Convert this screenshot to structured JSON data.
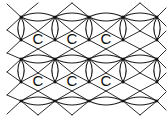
{
  "figure": {
    "kind": "chemical-structure-lattice",
    "background_color": "#ffffff",
    "line_color": "#1a1a1a",
    "vertex_color": "#111111",
    "label_color": "#0d0d0d",
    "canvas": {
      "width": 168,
      "height": 120
    }
  },
  "lattice": {
    "ring_columns": 3,
    "ring_rows": 2,
    "vertex_columns_x": [
      21,
      55,
      89,
      123,
      157
    ],
    "vertex_rows_y": [
      17,
      40,
      59,
      82,
      101
    ],
    "lens_bulge": 4.0,
    "vertex_size": 2.6
  },
  "atoms": [
    {
      "label": "C",
      "x": 38,
      "y": 38
    },
    {
      "label": "C",
      "x": 72,
      "y": 38
    },
    {
      "label": "C",
      "x": 106,
      "y": 38
    },
    {
      "label": "C",
      "x": 38,
      "y": 80
    },
    {
      "label": "C",
      "x": 72,
      "y": 80
    },
    {
      "label": "C",
      "x": 106,
      "y": 80
    }
  ],
  "horizontal_lens_edges": [
    {
      "x1": 21,
      "x2": 55,
      "y": 17
    },
    {
      "x1": 55,
      "x2": 89,
      "y": 17
    },
    {
      "x1": 89,
      "x2": 123,
      "y": 17
    },
    {
      "x1": 123,
      "x2": 157,
      "y": 17
    },
    {
      "x1": 21,
      "x2": 55,
      "y": 59
    },
    {
      "x1": 55,
      "x2": 89,
      "y": 59
    },
    {
      "x1": 89,
      "x2": 123,
      "y": 59
    },
    {
      "x1": 123,
      "x2": 157,
      "y": 59
    },
    {
      "x1": 21,
      "x2": 55,
      "y": 101
    },
    {
      "x1": 55,
      "x2": 89,
      "y": 101
    },
    {
      "x1": 89,
      "x2": 123,
      "y": 101
    },
    {
      "x1": 123,
      "x2": 157,
      "y": 101
    }
  ],
  "vertical_lens_edges": [
    {
      "x": 21,
      "y1": 17,
      "y2": 40
    },
    {
      "x": 55,
      "y1": 17,
      "y2": 40
    },
    {
      "x": 89,
      "y1": 17,
      "y2": 40
    },
    {
      "x": 123,
      "y1": 17,
      "y2": 40
    },
    {
      "x": 157,
      "y1": 17,
      "y2": 40
    },
    {
      "x": 21,
      "y1": 59,
      "y2": 82
    },
    {
      "x": 55,
      "y1": 59,
      "y2": 82
    },
    {
      "x": 89,
      "y1": 59,
      "y2": 82
    },
    {
      "x": 123,
      "y1": 59,
      "y2": 82
    },
    {
      "x": 157,
      "y1": 59,
      "y2": 82
    }
  ],
  "diagonal_edges": [
    {
      "x1": 21,
      "y1": 17,
      "x2": 7,
      "y2": 4
    },
    {
      "x1": 21,
      "y1": 17,
      "x2": 7,
      "y2": 30
    },
    {
      "x1": 21,
      "y1": 40,
      "x2": 7,
      "y2": 30
    },
    {
      "x1": 21,
      "y1": 40,
      "x2": 7,
      "y2": 53
    },
    {
      "x1": 21,
      "y1": 59,
      "x2": 7,
      "y2": 53
    },
    {
      "x1": 21,
      "y1": 59,
      "x2": 7,
      "y2": 72
    },
    {
      "x1": 21,
      "y1": 82,
      "x2": 7,
      "y2": 72
    },
    {
      "x1": 21,
      "y1": 82,
      "x2": 7,
      "y2": 95
    },
    {
      "x1": 21,
      "y1": 101,
      "x2": 7,
      "y2": 95
    },
    {
      "x1": 21,
      "y1": 101,
      "x2": 7,
      "y2": 114
    },
    {
      "x1": 55,
      "y1": 17,
      "x2": 72,
      "y2": 3
    },
    {
      "x1": 89,
      "y1": 17,
      "x2": 72,
      "y2": 3
    },
    {
      "x1": 123,
      "y1": 17,
      "x2": 140,
      "y2": 3
    },
    {
      "x1": 157,
      "y1": 17,
      "x2": 140,
      "y2": 3
    },
    {
      "x1": 21,
      "y1": 17,
      "x2": 38,
      "y2": 3
    },
    {
      "x1": 55,
      "y1": 17,
      "x2": 72,
      "y2": 31
    },
    {
      "x1": 89,
      "y1": 17,
      "x2": 72,
      "y2": 31
    },
    {
      "x1": 55,
      "y1": 40,
      "x2": 72,
      "y2": 31
    },
    {
      "x1": 89,
      "y1": 40,
      "x2": 72,
      "y2": 31
    },
    {
      "x1": 123,
      "y1": 17,
      "x2": 140,
      "y2": 31
    },
    {
      "x1": 157,
      "y1": 17,
      "x2": 140,
      "y2": 31
    },
    {
      "x1": 123,
      "y1": 40,
      "x2": 140,
      "y2": 31
    },
    {
      "x1": 157,
      "y1": 40,
      "x2": 140,
      "y2": 31
    },
    {
      "x1": 55,
      "y1": 40,
      "x2": 72,
      "y2": 49
    },
    {
      "x1": 89,
      "y1": 40,
      "x2": 72,
      "y2": 49
    },
    {
      "x1": 55,
      "y1": 59,
      "x2": 72,
      "y2": 49
    },
    {
      "x1": 89,
      "y1": 59,
      "x2": 72,
      "y2": 49
    },
    {
      "x1": 123,
      "y1": 40,
      "x2": 140,
      "y2": 49
    },
    {
      "x1": 157,
      "y1": 40,
      "x2": 140,
      "y2": 49
    },
    {
      "x1": 123,
      "y1": 59,
      "x2": 140,
      "y2": 49
    },
    {
      "x1": 157,
      "y1": 59,
      "x2": 140,
      "y2": 49
    },
    {
      "x1": 21,
      "y1": 40,
      "x2": 38,
      "y2": 49
    },
    {
      "x1": 55,
      "y1": 40,
      "x2": 38,
      "y2": 49
    },
    {
      "x1": 21,
      "y1": 59,
      "x2": 38,
      "y2": 49
    },
    {
      "x1": 55,
      "y1": 59,
      "x2": 38,
      "y2": 49
    },
    {
      "x1": 21,
      "y1": 40,
      "x2": 38,
      "y2": 31
    },
    {
      "x1": 55,
      "y1": 40,
      "x2": 38,
      "y2": 31
    },
    {
      "x1": 21,
      "y1": 17,
      "x2": 38,
      "y2": 31
    },
    {
      "x1": 55,
      "y1": 17,
      "x2": 38,
      "y2": 31
    },
    {
      "x1": 89,
      "y1": 40,
      "x2": 106,
      "y2": 31
    },
    {
      "x1": 123,
      "y1": 40,
      "x2": 106,
      "y2": 31
    },
    {
      "x1": 89,
      "y1": 17,
      "x2": 106,
      "y2": 31
    },
    {
      "x1": 123,
      "y1": 17,
      "x2": 106,
      "y2": 31
    },
    {
      "x1": 89,
      "y1": 40,
      "x2": 106,
      "y2": 49
    },
    {
      "x1": 123,
      "y1": 40,
      "x2": 106,
      "y2": 49
    },
    {
      "x1": 89,
      "y1": 59,
      "x2": 106,
      "y2": 49
    },
    {
      "x1": 123,
      "y1": 59,
      "x2": 106,
      "y2": 49
    },
    {
      "x1": 21,
      "y1": 82,
      "x2": 38,
      "y2": 91
    },
    {
      "x1": 55,
      "y1": 82,
      "x2": 38,
      "y2": 91
    },
    {
      "x1": 21,
      "y1": 101,
      "x2": 38,
      "y2": 91
    },
    {
      "x1": 55,
      "y1": 101,
      "x2": 38,
      "y2": 91
    },
    {
      "x1": 21,
      "y1": 82,
      "x2": 38,
      "y2": 73
    },
    {
      "x1": 55,
      "y1": 82,
      "x2": 38,
      "y2": 73
    },
    {
      "x1": 21,
      "y1": 59,
      "x2": 38,
      "y2": 73
    },
    {
      "x1": 55,
      "y1": 59,
      "x2": 38,
      "y2": 73
    },
    {
      "x1": 55,
      "y1": 82,
      "x2": 72,
      "y2": 73
    },
    {
      "x1": 89,
      "y1": 82,
      "x2": 72,
      "y2": 73
    },
    {
      "x1": 55,
      "y1": 59,
      "x2": 72,
      "y2": 73
    },
    {
      "x1": 89,
      "y1": 59,
      "x2": 72,
      "y2": 73
    },
    {
      "x1": 55,
      "y1": 82,
      "x2": 72,
      "y2": 91
    },
    {
      "x1": 89,
      "y1": 82,
      "x2": 72,
      "y2": 91
    },
    {
      "x1": 55,
      "y1": 101,
      "x2": 72,
      "y2": 91
    },
    {
      "x1": 89,
      "y1": 101,
      "x2": 72,
      "y2": 91
    },
    {
      "x1": 89,
      "y1": 82,
      "x2": 106,
      "y2": 73
    },
    {
      "x1": 123,
      "y1": 82,
      "x2": 106,
      "y2": 73
    },
    {
      "x1": 89,
      "y1": 59,
      "x2": 106,
      "y2": 73
    },
    {
      "x1": 123,
      "y1": 59,
      "x2": 106,
      "y2": 73
    },
    {
      "x1": 89,
      "y1": 82,
      "x2": 106,
      "y2": 91
    },
    {
      "x1": 123,
      "y1": 82,
      "x2": 106,
      "y2": 91
    },
    {
      "x1": 89,
      "y1": 101,
      "x2": 106,
      "y2": 91
    },
    {
      "x1": 123,
      "y1": 101,
      "x2": 106,
      "y2": 91
    },
    {
      "x1": 123,
      "y1": 82,
      "x2": 140,
      "y2": 73
    },
    {
      "x1": 157,
      "y1": 82,
      "x2": 140,
      "y2": 73
    },
    {
      "x1": 123,
      "y1": 59,
      "x2": 140,
      "y2": 73
    },
    {
      "x1": 157,
      "y1": 59,
      "x2": 140,
      "y2": 73
    },
    {
      "x1": 123,
      "y1": 82,
      "x2": 140,
      "y2": 91
    },
    {
      "x1": 157,
      "y1": 82,
      "x2": 140,
      "y2": 91
    },
    {
      "x1": 123,
      "y1": 101,
      "x2": 140,
      "y2": 91
    },
    {
      "x1": 157,
      "y1": 101,
      "x2": 140,
      "y2": 91
    },
    {
      "x1": 157,
      "y1": 17,
      "x2": 166,
      "y2": 8
    },
    {
      "x1": 157,
      "y1": 17,
      "x2": 166,
      "y2": 26
    },
    {
      "x1": 157,
      "y1": 40,
      "x2": 166,
      "y2": 31
    },
    {
      "x1": 157,
      "y1": 40,
      "x2": 166,
      "y2": 49
    },
    {
      "x1": 157,
      "y1": 59,
      "x2": 166,
      "y2": 50
    },
    {
      "x1": 157,
      "y1": 59,
      "x2": 166,
      "y2": 68
    },
    {
      "x1": 157,
      "y1": 82,
      "x2": 166,
      "y2": 73
    },
    {
      "x1": 157,
      "y1": 82,
      "x2": 166,
      "y2": 91
    },
    {
      "x1": 157,
      "y1": 101,
      "x2": 166,
      "y2": 92
    },
    {
      "x1": 157,
      "y1": 101,
      "x2": 166,
      "y2": 110
    },
    {
      "x1": 55,
      "y1": 101,
      "x2": 72,
      "y2": 115
    },
    {
      "x1": 89,
      "y1": 101,
      "x2": 72,
      "y2": 115
    },
    {
      "x1": 123,
      "y1": 101,
      "x2": 140,
      "y2": 115
    },
    {
      "x1": 157,
      "y1": 101,
      "x2": 140,
      "y2": 115
    },
    {
      "x1": 21,
      "y1": 101,
      "x2": 38,
      "y2": 115
    },
    {
      "x1": 55,
      "y1": 101,
      "x2": 38,
      "y2": 115
    }
  ],
  "vertices": [
    {
      "x": 21,
      "y": 17
    },
    {
      "x": 55,
      "y": 17
    },
    {
      "x": 89,
      "y": 17
    },
    {
      "x": 123,
      "y": 17
    },
    {
      "x": 157,
      "y": 17
    },
    {
      "x": 21,
      "y": 40
    },
    {
      "x": 55,
      "y": 40
    },
    {
      "x": 89,
      "y": 40
    },
    {
      "x": 123,
      "y": 40
    },
    {
      "x": 157,
      "y": 40
    },
    {
      "x": 21,
      "y": 59
    },
    {
      "x": 55,
      "y": 59
    },
    {
      "x": 89,
      "y": 59
    },
    {
      "x": 123,
      "y": 59
    },
    {
      "x": 157,
      "y": 59
    },
    {
      "x": 21,
      "y": 82
    },
    {
      "x": 55,
      "y": 82
    },
    {
      "x": 89,
      "y": 82
    },
    {
      "x": 123,
      "y": 82
    },
    {
      "x": 157,
      "y": 82
    },
    {
      "x": 21,
      "y": 101
    },
    {
      "x": 55,
      "y": 101
    },
    {
      "x": 89,
      "y": 101
    },
    {
      "x": 123,
      "y": 101
    },
    {
      "x": 157,
      "y": 101
    }
  ]
}
